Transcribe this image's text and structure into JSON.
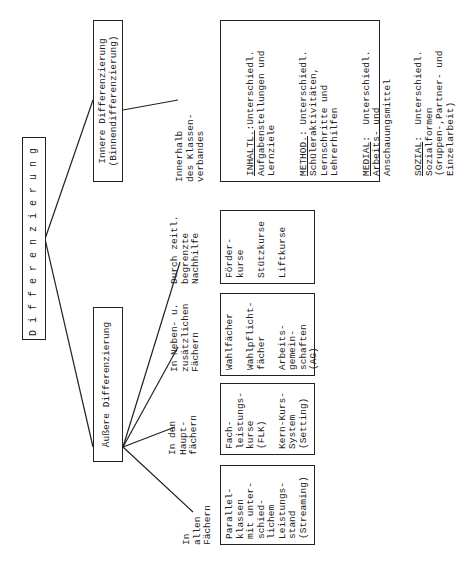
{
  "diagram": {
    "root": {
      "label": "Differenzierung"
    },
    "branches": [
      {
        "id": "aeussere",
        "label": "Äußere Differenzierung",
        "children": [
          {
            "label": "In\nallen\nFächern",
            "box": "Parallel-\nklassen\nmit unter-\nschied-\nlichem\nLeistungs-\nstand\n(Streaming)"
          },
          {
            "label": "In den\nHaupt-\nfächern",
            "box": "Fach-\nleistungs-\nkurse\n(FLK)\n\nKern-Kurs-\nSystem\n(Setting)"
          },
          {
            "label": "In Neben- u.\nzusätzlichen\nFächern",
            "box": "Wahlfächer\n\nWahlpflicht-\nfächer\n\nArbeits-\ngemein-\nschaften\n(AG)"
          },
          {
            "label": "Durch zeitl.\nbegrenzte\nNachhilfe",
            "box": "Förder-\nkurse\n\nStützkurse\n\nLiftkurse"
          }
        ]
      },
      {
        "id": "innere",
        "label": "Innere Differenzierung",
        "sublabel": "(Binnendifferenzierung)",
        "children": [
          {
            "label": "Innerhalb\ndes Klassen-\nverbandes",
            "box_items": [
              {
                "key": "INHALTL.",
                "text": ":Unterschiedl.\nAufgabenstellungen und\nLernziele"
              },
              {
                "key": "METHOD.",
                "text": ": Unterschiedl.\nSchüleraktivitäten,\nLernschritte und\nLehrerhilfen"
              },
              {
                "key": "MEDIAL",
                "text": ":  Unterschiedl.\nArbeits- und\nAnschauungsmittel"
              },
              {
                "key": "SOZIAL",
                "text": ":  Unterschiedl.\nSozialformen\n(Gruppen-,Partner- und\nEinzelarbeit)"
              }
            ]
          }
        ]
      }
    ]
  }
}
